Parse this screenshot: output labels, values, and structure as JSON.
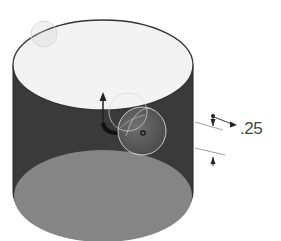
{
  "diagram": {
    "type": "3d-cad-view",
    "object": "cylinder",
    "dimension": {
      "label": ".25",
      "value": 0.25
    },
    "colors": {
      "background": "#ffffff",
      "top_face": "#f2f2f2",
      "side_wall": "#3a3a3a",
      "inner_bottom_face": "#808080",
      "outline": "#333333",
      "dimension_text": "#444444"
    },
    "annotations": [
      {
        "name": "up-direction-arrow"
      },
      {
        "name": "rotation-handle-sphere"
      },
      {
        "name": "center-point-marker"
      },
      {
        "name": "dimension-arrows"
      }
    ]
  }
}
